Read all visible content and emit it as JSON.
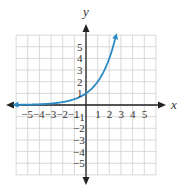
{
  "chart_data": {
    "type": "line",
    "title": "",
    "xlabel": "x",
    "ylabel": "y",
    "xlim": [
      -6,
      6
    ],
    "ylim": [
      -6,
      6
    ],
    "grid": true,
    "x_ticks": [
      -5,
      -4,
      -3,
      -2,
      -1,
      1,
      2,
      3,
      4,
      5
    ],
    "y_ticks": [
      5,
      4,
      3,
      2,
      1,
      -1,
      -2,
      -3,
      -4,
      -5
    ],
    "x_tick_labels": [
      "−5",
      "−4",
      "−3",
      "−2",
      "−1",
      "1",
      "2",
      "3",
      "4",
      "5"
    ],
    "y_tick_labels": [
      "5",
      "4",
      "3",
      "2",
      "1",
      "−1",
      "−2",
      "−3",
      "−4",
      "−5"
    ],
    "series": [
      {
        "name": "exponential curve",
        "function": "y = 2^x",
        "color": "#2a8ac4",
        "x": [
          -5.8,
          -5,
          -4,
          -3,
          -2,
          -1,
          0,
          1,
          2,
          2.5
        ],
        "y": [
          0.018,
          0.031,
          0.063,
          0.125,
          0.25,
          0.5,
          1,
          2,
          4,
          5.66
        ],
        "left_arrow": true,
        "right_arrow": true
      }
    ],
    "legend": null
  },
  "colors": {
    "axis": "#222222",
    "grid": "#cfcfcf",
    "curve": "#2a8ac4"
  }
}
